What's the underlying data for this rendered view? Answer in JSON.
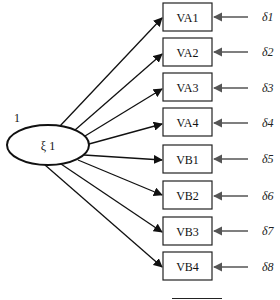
{
  "diagram": {
    "type": "sem-measurement-model",
    "latent": {
      "label": "ξ 1",
      "variance_label": "1"
    },
    "indicators": [
      {
        "label": "VA1",
        "error": "δ1"
      },
      {
        "label": "VA2",
        "error": "δ2"
      },
      {
        "label": "VA3",
        "error": "δ3"
      },
      {
        "label": "VA4",
        "error": "δ4"
      },
      {
        "label": "VB1",
        "error": "δ5"
      },
      {
        "label": "VB2",
        "error": "δ6"
      },
      {
        "label": "VB3",
        "error": "δ7"
      },
      {
        "label": "VB4",
        "error": "δ8"
      }
    ]
  }
}
